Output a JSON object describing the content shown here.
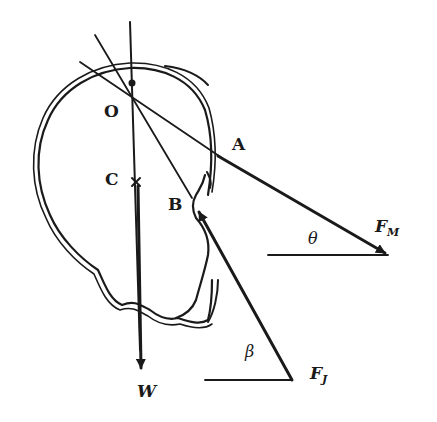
{
  "diagram": {
    "type": "free-body diagram of head/skull",
    "stroke_color": "#1a1a1a",
    "background": "#ffffff",
    "points": {
      "O": {
        "label": "O",
        "desc": "pivot point (occipital condyle)"
      },
      "C": {
        "label": "C",
        "desc": "center of gravity",
        "marker": "x"
      },
      "A": {
        "label": "A",
        "desc": "muscle attachment point"
      },
      "B": {
        "label": "B",
        "desc": "joint reaction point"
      }
    },
    "forces": {
      "W": {
        "label": "W",
        "desc": "weight, pointing down"
      },
      "FM": {
        "label": "F",
        "subscript": "M",
        "desc": "muscle force"
      },
      "FJ": {
        "label": "F",
        "subscript": "J",
        "desc": "joint reaction force"
      }
    },
    "angles": {
      "theta": {
        "label": "θ",
        "desc": "angle of F_M with horizontal"
      },
      "beta": {
        "label": "β",
        "desc": "angle of F_J with horizontal"
      }
    }
  }
}
